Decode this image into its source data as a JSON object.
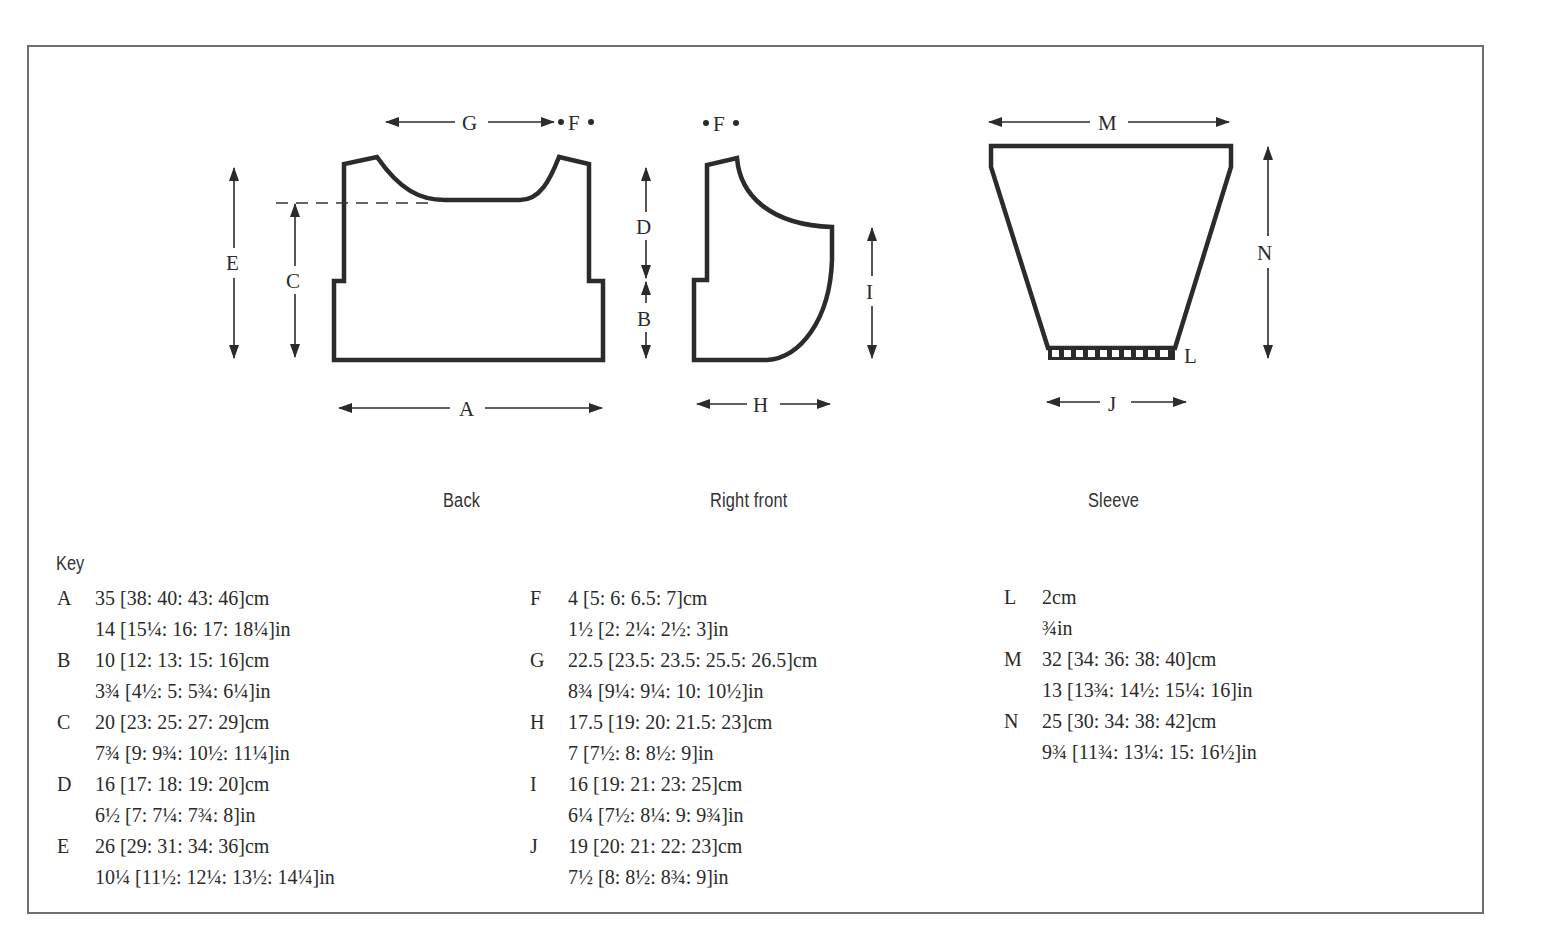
{
  "diagram": {
    "pieces": [
      {
        "id": "back",
        "caption": "Back"
      },
      {
        "id": "right_front",
        "caption": "Right front"
      },
      {
        "id": "sleeve",
        "caption": "Sleeve"
      }
    ],
    "dimension_labels": {
      "A": "A",
      "B": "B",
      "C": "C",
      "D": "D",
      "E": "E",
      "F": "F",
      "G": "G",
      "H": "H",
      "I": "I",
      "J": "J",
      "L": "L",
      "M": "M",
      "N": "N",
      "F_front": "F"
    }
  },
  "key": {
    "title": "Key",
    "columns": [
      [
        {
          "letter": "A",
          "cm": "35 [38: 40: 43: 46]cm",
          "in": "14 [15¼: 16: 17: 18¼]in"
        },
        {
          "letter": "B",
          "cm": "10 [12: 13: 15: 16]cm",
          "in": "3¾ [4½: 5: 5¾: 6¼]in"
        },
        {
          "letter": "C",
          "cm": "20 [23: 25: 27: 29]cm",
          "in": "7¾ [9: 9¾: 10½: 11¼]in"
        },
        {
          "letter": "D",
          "cm": "16 [17: 18: 19: 20]cm",
          "in": "6½ [7: 7¼: 7¾: 8]in"
        },
        {
          "letter": "E",
          "cm": "26 [29: 31: 34: 36]cm",
          "in": "10¼ [11½: 12¼: 13½: 14¼]in"
        }
      ],
      [
        {
          "letter": "F",
          "cm": "4 [5: 6: 6.5: 7]cm",
          "in": "1½ [2: 2¼: 2½: 3]in"
        },
        {
          "letter": "G",
          "cm": "22.5 [23.5: 23.5: 25.5: 26.5]cm",
          "in": "8¾ [9¼: 9¼: 10: 10½]in"
        },
        {
          "letter": "H",
          "cm": "17.5 [19: 20: 21.5: 23]cm",
          "in": "7 [7½: 8: 8½: 9]in"
        },
        {
          "letter": "I",
          "cm": "16 [19: 21: 23: 25]cm",
          "in": "6¼ [7½: 8¼: 9: 9¾]in"
        },
        {
          "letter": "J",
          "cm": "19 [20: 21: 22: 23]cm",
          "in": "7½ [8: 8½: 8¾: 9]in"
        }
      ],
      [
        {
          "letter": "L",
          "cm": "2cm",
          "in": "¾in"
        },
        {
          "letter": "M",
          "cm": "32 [34: 36: 38: 40]cm",
          "in": "13 [13¾: 14½: 15¼: 16]in"
        },
        {
          "letter": "N",
          "cm": "25 [30: 34: 38: 42]cm",
          "in": "9¾ [11¾: 13¼: 15: 16½]in"
        }
      ]
    ]
  }
}
